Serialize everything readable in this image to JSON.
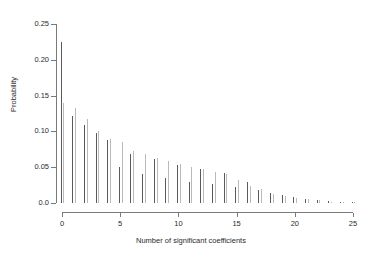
{
  "chart_data": {
    "type": "bar",
    "title": "",
    "subtitle": "",
    "xlabel": "Number of significant coefficients",
    "ylabel": "Probability",
    "xlim": [
      0,
      25
    ],
    "ylim": [
      0.0,
      0.25
    ],
    "xticks": [
      0,
      5,
      10,
      15,
      20,
      25
    ],
    "xticklabels": [
      "0",
      "5",
      "10",
      "15",
      "20",
      "25"
    ],
    "yticks": [
      0.0,
      0.05,
      0.1,
      0.15,
      0.2,
      0.25
    ],
    "yticklabels": [
      "0.0",
      "0.05",
      "0.10",
      "0.15",
      "0.20",
      "0.25"
    ],
    "grid": false,
    "legend": "none",
    "annotations": [],
    "x": [
      0,
      1,
      2,
      3,
      4,
      5,
      6,
      7,
      8,
      9,
      10,
      11,
      12,
      13,
      14,
      15,
      16,
      17,
      18,
      19,
      20,
      21,
      22,
      23,
      24,
      25
    ],
    "series": [
      {
        "name": "series-1",
        "color": "#5a5a5a",
        "values": [
          0.225,
          0.122,
          0.109,
          0.098,
          0.088,
          0.05,
          0.069,
          0.04,
          0.061,
          0.035,
          0.053,
          0.03,
          0.047,
          0.027,
          0.042,
          0.023,
          0.029,
          0.018,
          0.014,
          0.011,
          0.008,
          0.006,
          0.004,
          0.003,
          0.002,
          0.001
        ]
      },
      {
        "name": "series-2",
        "color": "#b9b9b9",
        "values": [
          0.14,
          0.133,
          0.118,
          0.1,
          0.09,
          0.085,
          0.072,
          0.068,
          0.063,
          0.058,
          0.055,
          0.05,
          0.048,
          0.044,
          0.04,
          0.032,
          0.024,
          0.019,
          0.013,
          0.01,
          0.007,
          0.005,
          0.004,
          0.002,
          0.002,
          0.001
        ]
      }
    ]
  },
  "figure": {
    "background": "#ffffff",
    "axis_color": "#7a7a7a",
    "text_color": "#2b2b2b"
  }
}
